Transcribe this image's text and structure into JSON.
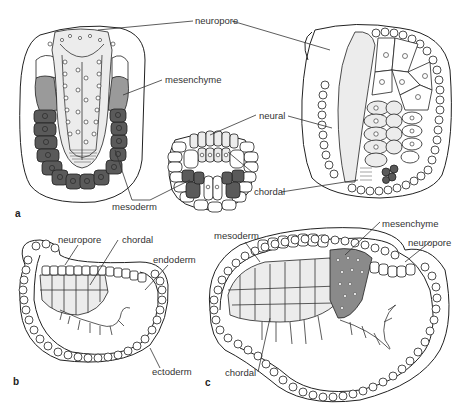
{
  "figure": {
    "panels": [
      {
        "id": "a",
        "label": "a",
        "labels": {
          "neuropore": "neuropore",
          "mesenchyme": "mesenchyme",
          "neural": "neural",
          "chordal": "chordal",
          "mesoderm": "mesoderm"
        }
      },
      {
        "id": "b",
        "label": "b",
        "labels": {
          "neuropore": "neuropore",
          "chordal": "chordal",
          "endoderm": "endoderm",
          "ectoderm": "ectoderm"
        }
      },
      {
        "id": "c",
        "label": "c",
        "labels": {
          "mesoderm": "mesoderm",
          "mesenchyme": "mesenchyme",
          "neuropore": "neuropore",
          "chordal": "chordal"
        }
      }
    ],
    "colors": {
      "dark_tissue": "#5a5a5a",
      "mid_tissue": "#9a9a9a",
      "stippled_tissue": "#ececec",
      "line": "#222222",
      "background": "#ffffff"
    }
  }
}
